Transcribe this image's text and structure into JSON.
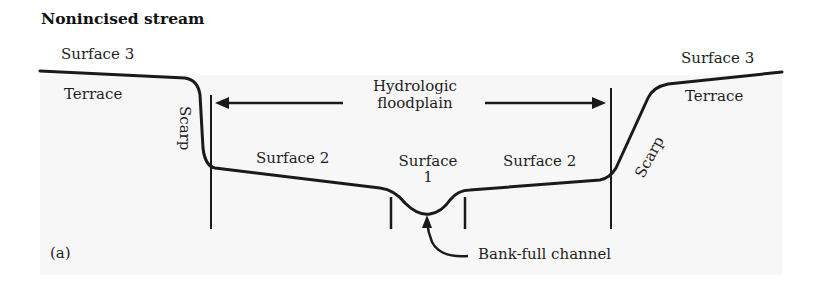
{
  "figure": {
    "title": "Nonincised stream",
    "panel_label": "(a)",
    "labels": {
      "surface3_left": "Surface 3",
      "surface3_right": "Surface 3",
      "terrace_left": "Terrace",
      "terrace_right": "Terrace",
      "scarp_left": "Scarp",
      "scarp_right": "Scarp",
      "floodplain_line1": "Hydrologic",
      "floodplain_line2": "floodplain",
      "surface2_left": "Surface 2",
      "surface2_right": "Surface 2",
      "surface1_line1": "Surface",
      "surface1_line2": "1",
      "bankfull": "Bank-full channel"
    },
    "colors": {
      "line": "#1a1a1a",
      "text": "#1e1e1e",
      "background": "#ffffff",
      "ground_fill": "#f7f7f7"
    }
  }
}
